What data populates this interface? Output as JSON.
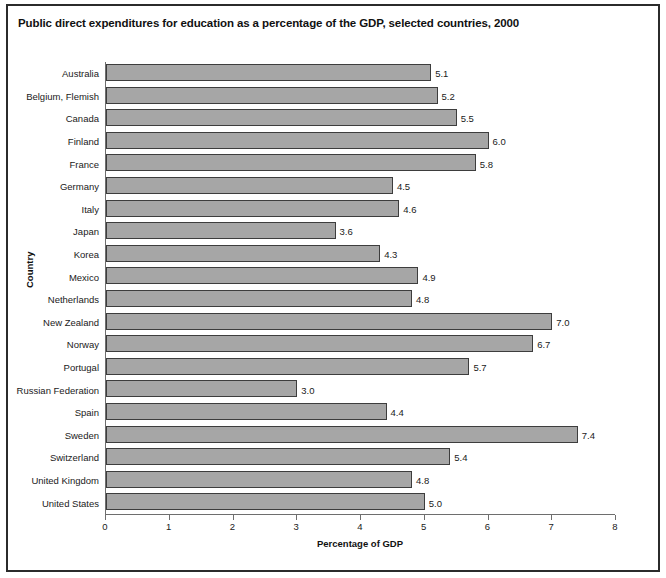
{
  "chart_data": {
    "type": "bar",
    "orientation": "horizontal",
    "title": "Public direct expenditures for education as a percentage of the GDP, selected countries, 2000",
    "xlabel": "Percentage of GDP",
    "ylabel": "Country",
    "xlim": [
      0,
      8
    ],
    "xticks": [
      "0",
      "1",
      "2",
      "3",
      "4",
      "5",
      "6",
      "7",
      "8"
    ],
    "grid": false,
    "legend": null,
    "bar_color": "#a6a6a6",
    "bar_edge_color": "#3d3d3d",
    "axis_color": "#6e6e6e",
    "categories": [
      "Australia",
      "Belgium, Flemish",
      "Canada",
      "Finland",
      "France",
      "Germany",
      "Italy",
      "Japan",
      "Korea",
      "Mexico",
      "Netherlands",
      "New Zealand",
      "Norway",
      "Portugal",
      "Russian Federation",
      "Spain",
      "Sweden",
      "Switzerland",
      "United Kingdom",
      "United States"
    ],
    "values": [
      5.1,
      5.2,
      5.5,
      6.0,
      5.8,
      4.5,
      4.6,
      3.6,
      4.3,
      4.9,
      4.8,
      7.0,
      6.7,
      5.7,
      3.0,
      4.4,
      7.4,
      5.4,
      4.8,
      5.0
    ],
    "value_labels": [
      "5.1",
      "5.2",
      "5.5",
      "6.0",
      "5.8",
      "4.5",
      "4.6",
      "3.6",
      "4.3",
      "4.9",
      "4.8",
      "7.0",
      "6.7",
      "5.7",
      "3.0",
      "4.4",
      "7.4",
      "5.4",
      "4.8",
      "5.0"
    ]
  }
}
